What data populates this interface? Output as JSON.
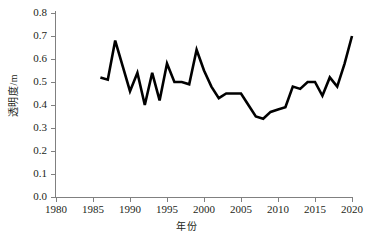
{
  "chart_data": {
    "type": "line",
    "title": "",
    "xlabel": "年份",
    "ylabel": "透明度/m",
    "xlim": [
      1980,
      2020
    ],
    "ylim": [
      0.0,
      0.8
    ],
    "grid": false,
    "legend": null,
    "x_ticks": [
      "1980",
      "1985",
      "1990",
      "1995",
      "2000",
      "2005",
      "2010",
      "2015",
      "2020"
    ],
    "x_tick_values": [
      1980,
      1985,
      1990,
      1995,
      2000,
      2005,
      2010,
      2015,
      2020
    ],
    "y_ticks": [
      "0.0",
      "0.1",
      "0.2",
      "0.3",
      "0.4",
      "0.5",
      "0.6",
      "0.7",
      "0.8"
    ],
    "y_tick_values": [
      0.0,
      0.1,
      0.2,
      0.3,
      0.4,
      0.5,
      0.6,
      0.7,
      0.8
    ],
    "series": [
      {
        "name": "透明度",
        "color": "#000000",
        "line_width": 2.6,
        "x": [
          1986,
          1987,
          1988,
          1989,
          1990,
          1991,
          1992,
          1993,
          1994,
          1995,
          1996,
          1997,
          1998,
          1999,
          2000,
          2001,
          2002,
          2003,
          2004,
          2005,
          2006,
          2007,
          2008,
          2009,
          2010,
          2011,
          2012,
          2013,
          2014,
          2015,
          2016,
          2017,
          2018,
          2019,
          2020
        ],
        "values": [
          0.52,
          0.51,
          0.68,
          0.57,
          0.46,
          0.54,
          0.4,
          0.54,
          0.42,
          0.58,
          0.5,
          0.5,
          0.49,
          0.64,
          0.55,
          0.48,
          0.43,
          0.45,
          0.45,
          0.45,
          0.4,
          0.35,
          0.34,
          0.37,
          0.38,
          0.39,
          0.48,
          0.47,
          0.5,
          0.5,
          0.44,
          0.52,
          0.48,
          0.58,
          0.7
        ]
      }
    ]
  }
}
